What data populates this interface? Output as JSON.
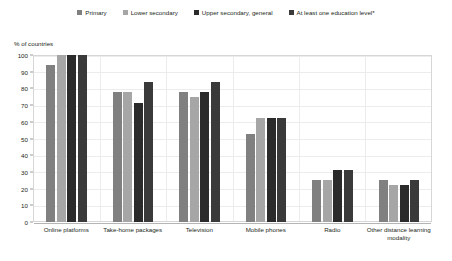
{
  "chart_data": {
    "type": "bar",
    "title": "",
    "subtitle": "",
    "xlabel": "",
    "ylabel": "% of countries",
    "ylim": [
      0,
      100
    ],
    "yticks": [
      0,
      10,
      20,
      30,
      40,
      50,
      60,
      70,
      80,
      90,
      100
    ],
    "grid": true,
    "legend_position": "top",
    "categories": [
      "Online platforms",
      "Take-home packages",
      "Television",
      "Mobile phones",
      "Radio",
      "Other distance learning modality"
    ],
    "series": [
      {
        "name": "Primary",
        "color": "#808080",
        "values": [
          94,
          78,
          78,
          53,
          25,
          25
        ]
      },
      {
        "name": "Lower secondary",
        "color": "#a6a6a6",
        "values": [
          100,
          78,
          75,
          62,
          25,
          22
        ]
      },
      {
        "name": "Upper secondary, general",
        "color": "#2b2b2b",
        "values": [
          100,
          71,
          78,
          62,
          31,
          22
        ]
      },
      {
        "name": "At least one education level*",
        "color": "#3a3a3a",
        "values": [
          100,
          84,
          84,
          62,
          31,
          25
        ]
      }
    ]
  },
  "legend": {
    "items": [
      {
        "label": "Primary",
        "color": "#808080"
      },
      {
        "label": "Lower secondary",
        "color": "#a6a6a6"
      },
      {
        "label": "Upper secondary, general",
        "color": "#2b2b2b"
      },
      {
        "label": "At least one education level*",
        "color": "#3a3a3a"
      }
    ]
  },
  "axis": {
    "y_title": "% of countries",
    "y_tick_labels": [
      "100",
      "90",
      "80",
      "70",
      "60",
      "50",
      "40",
      "30",
      "20",
      "10",
      "0"
    ]
  },
  "x_axis": {
    "labels": [
      "Online platforms",
      "Take-home packages",
      "Television",
      "Mobile phones",
      "Radio",
      "Other distance learning modality"
    ]
  },
  "colors": {
    "series_1": "#808080",
    "series_2": "#a6a6a6",
    "series_3": "#2b2b2b",
    "series_4": "#3a3a3a",
    "grid": "#ececec",
    "frame": "#d6d6d6",
    "text": "#231f20"
  }
}
